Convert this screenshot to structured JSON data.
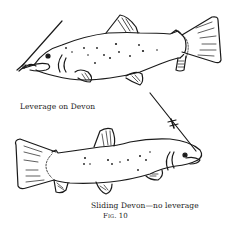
{
  "figure": {
    "caption_top": "Leverage on Devon",
    "caption_bottom": "Sliding Devon—no leverage",
    "figure_label": "Fig. 10",
    "ink_color": "#1a1a1a",
    "paper_color": "#ffffff"
  }
}
